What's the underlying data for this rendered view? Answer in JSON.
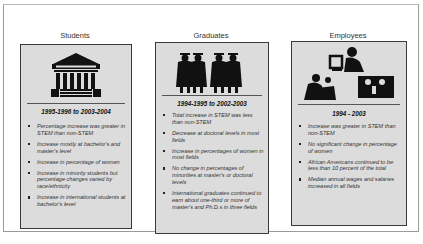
{
  "columns": [
    {
      "title": "Students",
      "icon": "university-building-icon",
      "period": "1995-1996 to 2003-2004",
      "bullets": [
        "Percentage increase was greater in STEM than non-STEM",
        "Increase mostly at bachelor's and master's level",
        "Increase in percentage of women",
        "Increase in minority students but percentage changes varied by race/ethnicity",
        "Increase in international students at bachelor's level"
      ]
    },
    {
      "title": "Graduates",
      "icon": "graduates-in-caps-icon",
      "period": "1994-1995 to 2002-2003",
      "bullets": [
        "Total increase in STEM was less than non-STEM",
        "Decrease at doctoral levels in most fields",
        "Increase in percentages of women in most fields",
        "No change in percentages of minorities at master's or doctoral levels",
        "International graduates continued to earn about one-third or more of master's and Ph.D.s in three fields"
      ]
    },
    {
      "title": "Employees",
      "icon": "workers-at-desks-icon",
      "period": "1994 - 2003",
      "bullets": [
        "Increase was greater in STEM than non-STEM",
        "No significant change in percentage of women",
        "African Americans continued to be less than 10 percent of the total",
        "Median annual wages and salaries increased in all fields"
      ]
    }
  ],
  "colors": {
    "panel_fill": "#dcdcdc",
    "panel_border": "#3a3a3a",
    "icon_fill": "#111111"
  }
}
